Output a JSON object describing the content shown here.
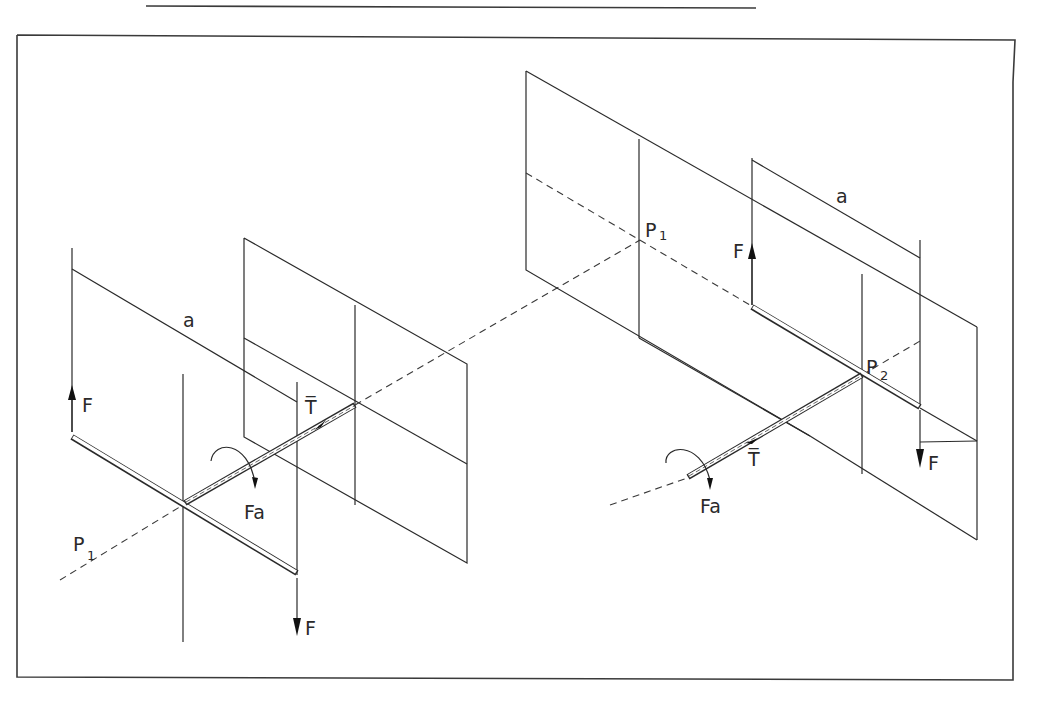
{
  "diagram": {
    "type": "isometric mechanics sketch: force couples on shafts",
    "left_assembly": {
      "labels": {
        "force_up": "F",
        "force_down": "F",
        "lever_arm": "a",
        "torque": "T̅",
        "moment": "Fa",
        "point": "P",
        "point_sub": "1"
      }
    },
    "right_assembly": {
      "labels": {
        "force_up": "F",
        "force_down": "F",
        "lever_arm": "a",
        "torque": "T̅",
        "moment": "Fa",
        "point_1": "P",
        "point_1_sub": "1",
        "point_2": "P",
        "point_2_sub": "2"
      }
    }
  }
}
